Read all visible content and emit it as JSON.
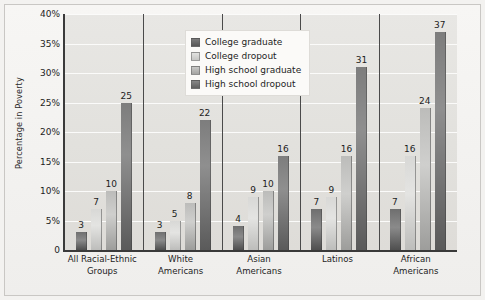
{
  "chart_data": {
    "type": "bar",
    "title": "",
    "xlabel": "",
    "ylabel": "Percentage in Poverty",
    "ylim": [
      0,
      40
    ],
    "grid": true,
    "legend_position": "top-center",
    "ytick_labels": [
      "40%",
      "35%",
      "30%",
      "25%",
      "20%",
      "15%",
      "10%",
      "5%",
      "0"
    ],
    "ytick_values": [
      40,
      35,
      30,
      25,
      20,
      15,
      10,
      5,
      0
    ],
    "categories": [
      "All Racial-Ethnic Groups",
      "White Americans",
      "Asian Americans",
      "Latinos",
      "African Americans"
    ],
    "category_lines": [
      [
        "All Racial-Ethnic",
        "Groups"
      ],
      [
        "White",
        "Americans"
      ],
      [
        "Asian",
        "Americans"
      ],
      [
        "Latinos"
      ],
      [
        "African",
        "Americans"
      ]
    ],
    "series": [
      {
        "name": "College graduate",
        "values": [
          3,
          3,
          4,
          7,
          7
        ]
      },
      {
        "name": "College dropout",
        "values": [
          7,
          5,
          9,
          9,
          16
        ]
      },
      {
        "name": "High school graduate",
        "values": [
          10,
          8,
          10,
          16,
          24
        ]
      },
      {
        "name": "High school dropout",
        "values": [
          25,
          22,
          16,
          31,
          37
        ]
      }
    ]
  },
  "legend": {
    "items": [
      {
        "label": "College graduate"
      },
      {
        "label": "College dropout"
      },
      {
        "label": "High school graduate"
      },
      {
        "label": "High school dropout"
      }
    ]
  },
  "colors": {
    "college_graduate": "#6f6f6f",
    "college_dropout": "#dcdcda",
    "high_school_graduate": "#bcbcba",
    "high_school_dropout": "#7d7d7d",
    "plot_background": "#e4e3e0",
    "gridline": "#fbfbfa",
    "axis": "#3a3a3a",
    "text": "#1d1d1d"
  }
}
